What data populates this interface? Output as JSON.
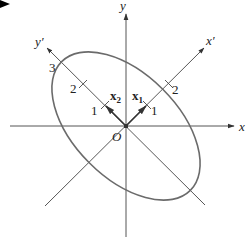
{
  "figure": {
    "type": "ellipse with principal axes diagram",
    "colors": {
      "axis": "#555555",
      "ellipse": "#6b6b6b",
      "text": "#222222",
      "corner_marker": "#000000"
    },
    "axes": {
      "x_label": "x",
      "y_label": "y",
      "x_prime_label": "x′",
      "y_prime_label": "y′",
      "origin_label": "O"
    },
    "vectors": {
      "x1_label": "x",
      "x1_sub": "1",
      "x2_label": "x",
      "x2_sub": "2"
    },
    "ticks": {
      "x_prime": [
        "1",
        "2"
      ],
      "y_prime": [
        "1",
        "2",
        "3"
      ]
    }
  }
}
